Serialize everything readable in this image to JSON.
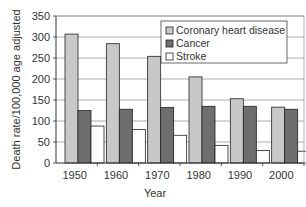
{
  "chart_data": {
    "type": "bar",
    "title": "",
    "xlabel": "Year",
    "ylabel": "Death rate/100,000 age adjusted",
    "ylim": [
      0,
      350
    ],
    "yticks": [
      0,
      50,
      100,
      150,
      200,
      250,
      300,
      350
    ],
    "grid": true,
    "legend_position": "top-right inside",
    "categories": [
      "1950",
      "1960",
      "1970",
      "1980",
      "1990",
      "2000"
    ],
    "series": [
      {
        "name": "Coronary heart disease",
        "color": "#c8c8c8",
        "values": [
          307,
          284,
          254,
          205,
          153,
          133
        ]
      },
      {
        "name": "Cancer",
        "color": "#6e6e6e",
        "values": [
          125,
          128,
          132,
          135,
          135,
          128
        ]
      },
      {
        "name": "Stroke",
        "color": "#ffffff",
        "values": [
          88,
          80,
          66,
          42,
          30,
          28
        ]
      }
    ]
  }
}
